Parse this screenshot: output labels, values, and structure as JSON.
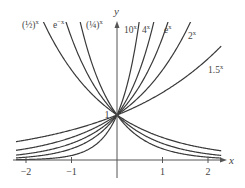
{
  "chart_data": {
    "type": "line",
    "title": "",
    "xlabel": "x",
    "ylabel": "y",
    "xlim": [
      -2.22,
      2.29
    ],
    "ylim": [
      0,
      3
    ],
    "grid": false,
    "legend": "inline labels at curve ends",
    "x_ticks": [
      {
        "value": -2,
        "label": "−2"
      },
      {
        "value": -1,
        "label": "−1"
      },
      {
        "value": 1,
        "label": "1"
      },
      {
        "value": 2,
        "label": "2"
      }
    ],
    "y_ticks": [
      {
        "value": 1,
        "label": "1"
      }
    ],
    "series": [
      {
        "name": "(1/2)^x",
        "base": 0.5,
        "label_base": "(½)",
        "label_exp": "x",
        "label_pos": [
          22,
          28
        ]
      },
      {
        "name": "e^-x",
        "base": 0.36787944,
        "label_base": "e",
        "label_exp": "−x",
        "label_pos": [
          53,
          28
        ]
      },
      {
        "name": "(1/4)^x",
        "base": 0.25,
        "label_base": "(¼)",
        "label_exp": "x",
        "label_pos": [
          86,
          28
        ]
      },
      {
        "name": "10^x",
        "base": 10,
        "label_base": "10",
        "label_exp": "x",
        "label_pos": [
          124,
          33
        ]
      },
      {
        "name": "4^x",
        "base": 4,
        "label_base": "4",
        "label_exp": "x",
        "label_pos": [
          142,
          33
        ]
      },
      {
        "name": "e^x",
        "base": 2.7182818,
        "label_base": "e",
        "label_exp": "x",
        "label_pos": [
          164,
          33
        ]
      },
      {
        "name": "2^x",
        "base": 2,
        "label_base": "2",
        "label_exp": "x",
        "label_pos": [
          188,
          39
        ]
      },
      {
        "name": "1.5^x",
        "base": 1.5,
        "label_base": "1.5",
        "label_exp": "x",
        "label_pos": [
          208,
          73
        ]
      }
    ],
    "annotations": [
      "All curves pass through (0, 1)"
    ]
  },
  "axes": {
    "x_label": "x",
    "y_label": "y",
    "y_intercept_label": "1"
  }
}
